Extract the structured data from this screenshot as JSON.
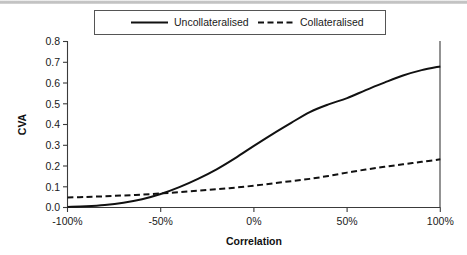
{
  "chart_data": {
    "type": "line",
    "title": "",
    "xlabel": "Correlation",
    "ylabel": "CVA",
    "xlim": [
      -100,
      100
    ],
    "ylim": [
      0.0,
      0.8
    ],
    "grid": false,
    "legend_position": "top",
    "x_ticks": [
      "-100%",
      "-50%",
      "0%",
      "50%",
      "100%"
    ],
    "x_tick_values": [
      -100,
      -50,
      0,
      50,
      100
    ],
    "y_ticks": [
      "0.0",
      "0.1",
      "0.2",
      "0.3",
      "0.4",
      "0.5",
      "0.6",
      "0.7",
      "0.8"
    ],
    "y_tick_values": [
      0.0,
      0.1,
      0.2,
      0.3,
      0.4,
      0.5,
      0.6,
      0.7,
      0.8
    ],
    "x": [
      -100,
      -90,
      -80,
      -70,
      -60,
      -50,
      -40,
      -30,
      -20,
      -10,
      0,
      10,
      20,
      30,
      40,
      50,
      60,
      70,
      80,
      90,
      100
    ],
    "series": [
      {
        "name": "Uncollateralised",
        "style": "solid",
        "color": "#111111",
        "values": [
          0.003,
          0.006,
          0.012,
          0.023,
          0.04,
          0.065,
          0.098,
          0.138,
          0.184,
          0.238,
          0.297,
          0.354,
          0.408,
          0.46,
          0.497,
          0.527,
          0.566,
          0.602,
          0.636,
          0.662,
          0.68
        ]
      },
      {
        "name": "Collateralised",
        "style": "dashed",
        "color": "#111111",
        "values": [
          0.048,
          0.051,
          0.054,
          0.058,
          0.062,
          0.068,
          0.074,
          0.081,
          0.088,
          0.096,
          0.105,
          0.116,
          0.127,
          0.138,
          0.152,
          0.168,
          0.183,
          0.196,
          0.208,
          0.22,
          0.232
        ]
      }
    ]
  },
  "legend": {
    "entries": [
      {
        "label": "Uncollateralised",
        "style": "solid"
      },
      {
        "label": "Collateralised",
        "style": "dashed"
      }
    ]
  },
  "axes": {
    "x_title": "Correlation",
    "y_title": "CVA"
  },
  "colors": {
    "line": "#111111",
    "axis": "#3a3a3a",
    "text": "#1a1a1a",
    "background": "#ffffff"
  }
}
